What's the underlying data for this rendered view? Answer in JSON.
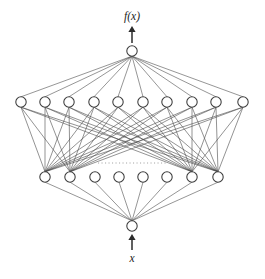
{
  "figure": {
    "output_label": "f(x)",
    "input_label": "x",
    "ellipsis_symbol": "· · · · · · · · · · ·",
    "colors": {
      "background": "#ffffff",
      "node_stroke": "#3a3a3a",
      "node_fill": "#ffffff",
      "edge": "#555555",
      "arrow": "#2b2b2b",
      "dots": "#9a9a9a",
      "label": "#1c1c1c"
    }
  },
  "chart_data": {
    "type": "diagram",
    "layers": [
      {
        "name": "output-layer",
        "role": "output",
        "count": 1,
        "y": 51,
        "radius": 5.2,
        "x_positions": [
          132
        ]
      },
      {
        "name": "hidden-layer-2",
        "role": "hidden",
        "count": 10,
        "y": 102,
        "radius": 5.2,
        "x_positions": [
          21,
          45,
          69,
          94,
          118,
          143,
          167,
          192,
          216,
          243
        ]
      },
      {
        "name": "hidden-layer-1",
        "role": "hidden",
        "count": 8,
        "y": 177,
        "radius": 5.2,
        "x_positions": [
          45,
          70,
          95,
          119,
          143,
          167,
          192,
          218
        ]
      },
      {
        "name": "input-layer",
        "role": "input",
        "count": 1,
        "y": 226,
        "radius": 5.2,
        "x_positions": [
          132
        ]
      }
    ],
    "connections": [
      {
        "from": "hidden-layer-2",
        "to": "output-layer",
        "pattern": "fan-in-all",
        "note": "all 10 upper hidden nodes connect to the single output node"
      },
      {
        "from": "hidden-layer-1",
        "to": "input-layer",
        "pattern": "fan-in-all",
        "note": "all 8 lower hidden nodes connect to the single input node"
      },
      {
        "from": "hidden-layer-1",
        "to": "hidden-layer-2",
        "pattern": "partial-dense",
        "note": "only the two leftmost and two rightmost lower nodes fan out densely to every upper node"
      }
    ],
    "dense_source_indices": [
      0,
      1,
      6,
      7
    ],
    "ellipsis": {
      "y": 163,
      "x_start": 98,
      "x_end": 168
    },
    "annotations": [
      {
        "text": "f(x)",
        "x": 132,
        "y": 20,
        "style": "italic",
        "anchor": "output-top"
      },
      {
        "text": "x",
        "x": 132,
        "y": 262,
        "style": "italic",
        "anchor": "input-bottom"
      }
    ],
    "arrows": [
      {
        "name": "output-arrow",
        "x": 132,
        "y_from": 43,
        "y_to": 26,
        "direction": "up"
      },
      {
        "name": "input-arrow",
        "x": 132,
        "y_from": 250,
        "y_to": 234,
        "direction": "up"
      }
    ],
    "xlabel": "",
    "ylabel": "",
    "grid": false,
    "legend": false
  }
}
